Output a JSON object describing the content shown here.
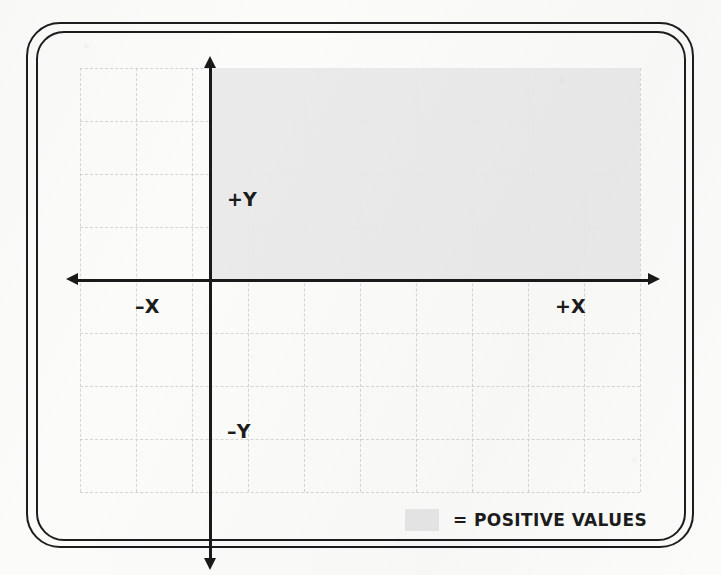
{
  "diagram": {
    "axis_labels": {
      "positive_y": "+Y",
      "negative_y": "–Y",
      "negative_x": "–X",
      "positive_x": "+X"
    },
    "legend": {
      "swatch_name": "positive-values-swatch",
      "label": "= POSITIVE VALUES"
    },
    "colors": {
      "shaded_region": "#e9e9e9",
      "axis": "#1a1a1a",
      "grid_line": "#cfcfcf",
      "frame": "#1d1d1d",
      "text": "#1c1c1c",
      "background": "#fbfbfa"
    }
  },
  "chart_data": {
    "type": "scatter",
    "title": "",
    "subtitle": "",
    "xlabel": "X",
    "ylabel": "Y",
    "xlim": [
      -4,
      8
    ],
    "ylim": [
      -6,
      6
    ],
    "grid": true,
    "grid_spacing": 1,
    "legend_position": "bottom-right",
    "series": [],
    "x": [],
    "values": [],
    "annotations": [
      {
        "text": "+Y",
        "x": 0.35,
        "y": 4.2
      },
      {
        "text": "–Y",
        "x": 0.35,
        "y": -2.4
      },
      {
        "text": "–X",
        "x": -2.6,
        "y": -0.55
      },
      {
        "text": "+X",
        "x": 6.4,
        "y": -0.55
      }
    ],
    "shaded_regions": [
      {
        "label": "= POSITIVE VALUES",
        "color": "#e9e9e9",
        "x_range": [
          0,
          8
        ],
        "y_range": [
          0,
          6
        ],
        "quadrant": "I"
      }
    ],
    "legend_entries": [
      {
        "label": "= POSITIVE VALUES",
        "color": "#e9e9e9"
      }
    ]
  },
  "grid_geometry": {
    "vertical_lines": [
      0,
      56,
      112,
      168,
      224,
      280,
      336,
      392,
      448,
      504,
      560
    ],
    "horizontal_lines": [
      0,
      53,
      106,
      159,
      212,
      265,
      318,
      371,
      424
    ],
    "origin_x": 130,
    "origin_y": 212,
    "shade_left": 130,
    "shade_top": 0,
    "shade_right": 560,
    "shade_bottom": 212
  }
}
